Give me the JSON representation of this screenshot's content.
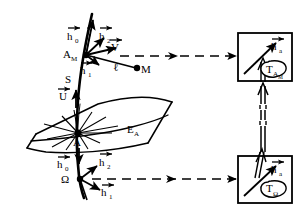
{
  "figure": {
    "type": "geometric-diagram",
    "background_color": "#ffffff",
    "ink_color": "#000000",
    "caption": "",
    "labels": {
      "point_am": "A",
      "point_am_sub": "M",
      "point_a": "A",
      "point_omega": "Ω",
      "point_m": "M",
      "curve_s": "S",
      "surface_ea": "E",
      "surface_ea_sub": "A",
      "segment_l": "ℓ",
      "vector_h0": "h",
      "vector_h0_sub": "0",
      "vector_h1": "h",
      "vector_h1_sub": "1",
      "vector_h2": "h",
      "vector_h2_sub": "2",
      "vector_u": "U",
      "vector_v": "V",
      "vector_ha": "h",
      "vector_ha_sub": "a",
      "tangent_space_am": "T",
      "tangent_space_am_sub": "A",
      "tangent_space_am_sub2": "M",
      "tangent_space_omega": "T",
      "tangent_space_omega_sub": "Ω"
    },
    "elements": {
      "upper_box": {
        "name": "tangent-space-box-am",
        "x": 240,
        "y": 33,
        "w": 52,
        "h": 48
      },
      "lower_box": {
        "name": "tangent-space-box-omega",
        "x": 240,
        "y": 157,
        "w": 52,
        "h": 46
      },
      "dashed_arrow_upper": {
        "from_x": 148,
        "from_y": 57,
        "to_x": 238,
        "to_y": 57
      },
      "dashed_arrow_lower": {
        "from_x": 108,
        "from_y": 180,
        "to_x": 238,
        "to_y": 180
      },
      "vertical_double_arrow": {
        "x": 263,
        "top_y": 84,
        "bottom_y": 154
      }
    },
    "vectors_at_am": [
      "h0",
      "h2",
      "V",
      "h1"
    ],
    "vectors_at_a": [
      "U",
      "h0"
    ],
    "vectors_at_omega": [
      "h2",
      "h1"
    ],
    "inset_vectors": [
      "ha"
    ]
  }
}
